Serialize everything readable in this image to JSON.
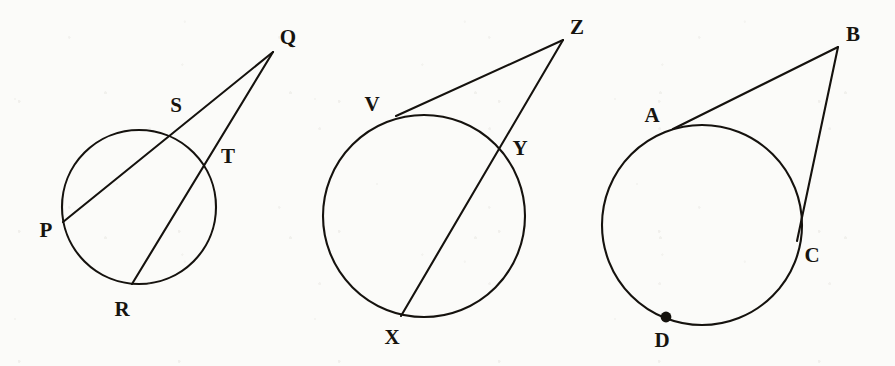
{
  "page": {
    "background_color": "#fbfbf9",
    "ink_color": "#15120e",
    "width": 895,
    "height": 366
  },
  "figures": [
    {
      "id": "figure-pqrst",
      "name": "secant-secant-from-external-point",
      "circle": {
        "cx": 139,
        "cy": 207,
        "r": 77
      },
      "external_point": {
        "label": "Q",
        "x": 273,
        "y": 52,
        "label_x": 288,
        "label_y": 39
      },
      "points": [
        {
          "label": "P",
          "x": 63,
          "y": 222,
          "label_x": 46,
          "label_y": 232
        },
        {
          "label": "S",
          "x": 183,
          "y": 128,
          "label_x": 176,
          "label_y": 107
        },
        {
          "label": "T",
          "x": 211,
          "y": 154,
          "label_x": 228,
          "label_y": 158
        },
        {
          "label": "R",
          "x": 132,
          "y": 284,
          "label_x": 122,
          "label_y": 311
        }
      ],
      "segments": [
        {
          "name": "secant-Q-S-P",
          "from": "Q",
          "to": "P"
        },
        {
          "name": "secant-Q-T-R",
          "from": "Q",
          "to": "R"
        }
      ],
      "dots": []
    },
    {
      "id": "figure-vxyz",
      "name": "tangent-secant-from-external-point",
      "circle": {
        "cx": 424,
        "cy": 216,
        "r": 101
      },
      "external_point": {
        "label": "Z",
        "x": 563,
        "y": 40,
        "label_x": 577,
        "label_y": 29
      },
      "points": [
        {
          "label": "V",
          "x": 396,
          "y": 116,
          "label_x": 372,
          "label_y": 106
        },
        {
          "label": "Y",
          "x": 503,
          "y": 147,
          "label_x": 520,
          "label_y": 150
        },
        {
          "label": "X",
          "x": 401,
          "y": 316,
          "label_x": 392,
          "label_y": 339
        }
      ],
      "segments": [
        {
          "name": "tangent-Z-V",
          "from": "Z",
          "to": "V"
        },
        {
          "name": "secant-Z-Y-X",
          "from": "Z",
          "to": "X"
        }
      ],
      "dots": []
    },
    {
      "id": "figure-abcd",
      "name": "tangent-secant-with-marked-point",
      "circle": {
        "cx": 702,
        "cy": 225,
        "r": 100
      },
      "external_point": {
        "label": "B",
        "x": 838,
        "y": 47,
        "label_x": 853,
        "label_y": 36
      },
      "points": [
        {
          "label": "A",
          "x": 673,
          "y": 129,
          "label_x": 652,
          "label_y": 117
        },
        {
          "label": "C",
          "x": 797,
          "y": 241,
          "label_x": 812,
          "label_y": 257
        },
        {
          "label": "D",
          "x": 666,
          "y": 317,
          "label_x": 662,
          "label_y": 342
        }
      ],
      "segments": [
        {
          "name": "tangent-B-A",
          "from": "B",
          "to": "A"
        },
        {
          "name": "secant-B-C",
          "from": "B",
          "to": "C"
        }
      ],
      "dots": [
        {
          "name": "marked-point-D",
          "x": 666,
          "y": 317,
          "r": 5.4
        }
      ]
    }
  ]
}
